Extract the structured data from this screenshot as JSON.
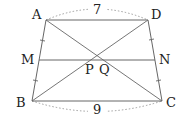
{
  "diagram": {
    "type": "trapezoid",
    "points": {
      "A": {
        "label": "A",
        "x": 46,
        "y": 20
      },
      "D": {
        "label": "D",
        "x": 148,
        "y": 20
      },
      "B": {
        "label": "B",
        "x": 32,
        "y": 101
      },
      "C": {
        "label": "C",
        "x": 162,
        "y": 101
      },
      "M": {
        "label": "M",
        "x": 39,
        "y": 60
      },
      "N": {
        "label": "N",
        "x": 155,
        "y": 60
      },
      "P": {
        "label": "P"
      },
      "Q": {
        "label": "Q"
      }
    },
    "measurements": {
      "AD": "7",
      "BC": "9"
    },
    "colors": {
      "line": "#666666",
      "dotted": "#888888",
      "text": "#222222"
    }
  }
}
